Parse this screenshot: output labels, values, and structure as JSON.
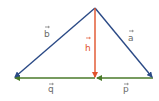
{
  "diagram": {
    "type": "vector-triangle",
    "colors": {
      "side": "#2b4a86",
      "altitude": "#e0522a",
      "base": "#4a7a2a",
      "label": "#6b6b6b",
      "altitude_label": "#e0522a"
    },
    "points": {
      "apex": [
        95,
        8
      ],
      "left": [
        14,
        78
      ],
      "right": [
        153,
        78
      ],
      "foot": [
        95,
        78
      ]
    },
    "vectors": [
      {
        "name": "b",
        "label": "b",
        "from": "apex",
        "to": "left",
        "color": "side"
      },
      {
        "name": "a",
        "label": "a",
        "from": "apex",
        "to": "right",
        "color": "side"
      },
      {
        "name": "h",
        "label": "h",
        "from": "apex",
        "to": "foot",
        "color": "altitude"
      },
      {
        "name": "q",
        "label": "q",
        "from": "foot",
        "to": "left",
        "color": "base"
      },
      {
        "name": "p",
        "label": "p",
        "from": "right",
        "to": "foot",
        "color": "base"
      }
    ]
  }
}
